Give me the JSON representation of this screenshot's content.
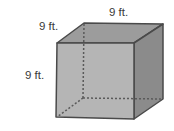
{
  "figure": {
    "shape": "cube",
    "labels": {
      "top_depth": "9 ft.",
      "top_width": "9 ft.",
      "height": "9 ft."
    },
    "colors": {
      "front_face": "#b5b5b5",
      "top_face": "#9c9c9c",
      "right_face": "#8b8b8b",
      "edge": "#4a4a4a",
      "hidden_edge": "#5a5a5a",
      "label_text": "#3a3a3a"
    }
  }
}
